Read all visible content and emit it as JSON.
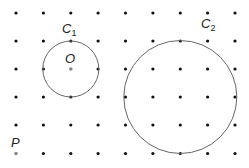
{
  "grid": {
    "xs": [
      16,
      43.4,
      70.8,
      98.1,
      125.5,
      152.9,
      180.3,
      207.6,
      235
    ],
    "ys": [
      13,
      41,
      69,
      97,
      125,
      153.5
    ],
    "dot_radius": 1.6,
    "dot_color": "#111111"
  },
  "circles": [
    {
      "name": "C1",
      "cx": 70.8,
      "cy": 69,
      "r": 28,
      "stroke": "#666666"
    },
    {
      "name": "C2",
      "cx": 180.3,
      "cy": 97,
      "r": 56.5,
      "stroke": "#666666"
    }
  ],
  "points": [
    {
      "name": "O",
      "x": 70.8,
      "y": 69,
      "color": "#888888"
    },
    {
      "name": "P",
      "x": 16,
      "y": 153.5,
      "color": "#888888"
    }
  ],
  "labels": {
    "c1_main": "C",
    "c1_sub": "1",
    "c2_main": "C",
    "c2_sub": "2",
    "o": "O",
    "p": "P"
  }
}
